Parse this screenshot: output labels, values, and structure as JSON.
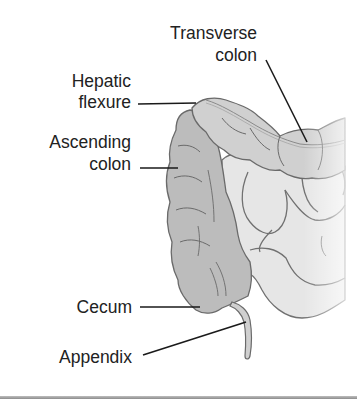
{
  "diagram": {
    "labels": {
      "transverse_colon": {
        "line1": "Transverse",
        "line2": "colon"
      },
      "hepatic_flexure": {
        "line1": "Hepatic",
        "line2": "flexure"
      },
      "ascending_colon": {
        "line1": "Ascending",
        "line2": "colon"
      },
      "cecum": {
        "line1": "Cecum"
      },
      "appendix": {
        "line1": "Appendix"
      }
    },
    "colors": {
      "ascending_fill": "#b9b9b9",
      "transverse_fill": "#cfcfcf",
      "small_bowel_fill": "#e3e3e3",
      "outline": "#6e6e6e",
      "leader_line": "#1a1a1a",
      "text": "#222222",
      "bottom_rule": "#9a9a9a"
    }
  }
}
